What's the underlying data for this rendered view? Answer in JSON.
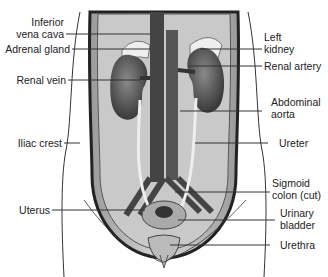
{
  "diagram": {
    "labels_left": [
      {
        "id": "ivc",
        "line1": "Inferior",
        "line2": "vena cava"
      },
      {
        "id": "adrenal",
        "line1": "Adrenal gland"
      },
      {
        "id": "renal-vein",
        "line1": "Renal vein"
      },
      {
        "id": "iliac",
        "line1": "Iliac crest"
      },
      {
        "id": "uterus",
        "line1": "Uterus"
      }
    ],
    "labels_right": [
      {
        "id": "left-kidney",
        "line1": "Left",
        "line2": "kidney"
      },
      {
        "id": "renal-artery",
        "line1": "Renal artery"
      },
      {
        "id": "aorta",
        "line1": "Abdominal",
        "line2": "aorta"
      },
      {
        "id": "ureter",
        "line1": "Ureter"
      },
      {
        "id": "sigmoid",
        "line1": "Sigmoid",
        "line2": "colon (cut)"
      },
      {
        "id": "bladder",
        "line1": "Urinary",
        "line2": "bladder"
      },
      {
        "id": "urethra",
        "line1": "Urethra"
      }
    ]
  }
}
